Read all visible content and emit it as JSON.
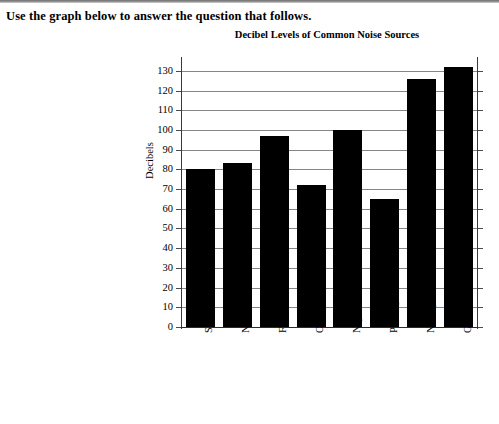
{
  "page": {
    "prompt": "Use the graph below to answer the question that follows."
  },
  "chart_data": {
    "type": "bar",
    "title": "Decibel Levels of Common Noise Sources",
    "xlabel": "",
    "ylabel": "Decibels",
    "ylim": [
      0,
      130
    ],
    "ytick_step": 10,
    "grid": true,
    "legend": false,
    "bar_color": "#000000",
    "gridline_color": "#868686",
    "categories": [
      "Shout",
      "Noisy office",
      "Factory",
      "Orchestra",
      "Nightclub",
      "Passing train",
      "Nearby thunder",
      "Gunfire"
    ],
    "values": [
      80,
      83,
      97,
      72,
      100,
      65,
      126,
      132
    ],
    "yticks": [
      0,
      10,
      20,
      30,
      40,
      50,
      60,
      70,
      80,
      90,
      100,
      110,
      120,
      130
    ]
  }
}
